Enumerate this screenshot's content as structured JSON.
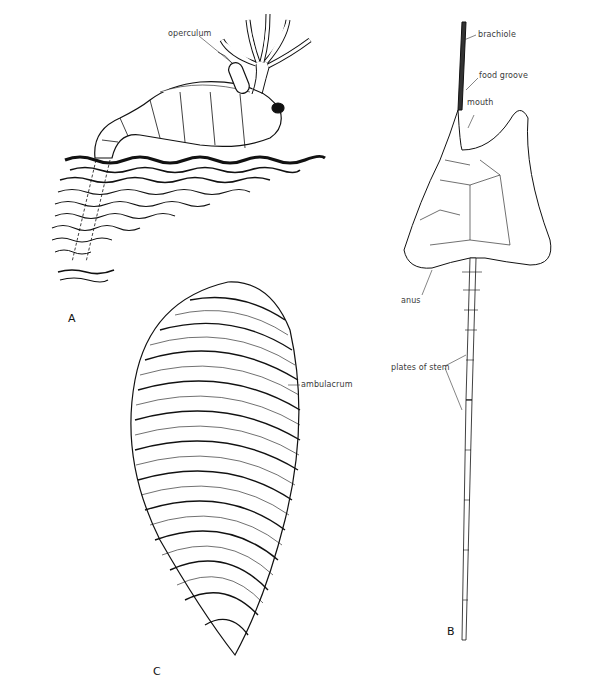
{
  "figure": {
    "panels": [
      {
        "id": "A",
        "letter": "A",
        "labels": {
          "operculum": "operculum"
        }
      },
      {
        "id": "B",
        "letter": "B",
        "labels": {
          "brachiole": "brachiole",
          "food_groove": "food groove",
          "mouth": "mouth",
          "anus": "anus",
          "plates_of_stem": "plates of stem"
        }
      },
      {
        "id": "C",
        "letter": "C",
        "labels": {
          "ambulacrum": "ambulacrum"
        }
      }
    ],
    "caption": ""
  },
  "colors": {
    "ink": "#111111",
    "label": "#3a3a3a",
    "background": "#ffffff"
  }
}
